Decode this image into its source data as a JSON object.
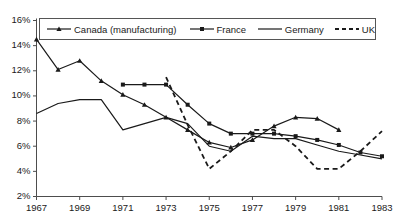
{
  "chart_data": {
    "type": "line",
    "title": "",
    "xlabel": "",
    "ylabel": "",
    "xlim": [
      1967,
      1983
    ],
    "ylim": [
      2,
      16
    ],
    "ytick_suffix": "%",
    "grid": false,
    "legend_position": "top",
    "xticks": [
      1967,
      1969,
      1971,
      1973,
      1975,
      1977,
      1979,
      1981,
      1983
    ],
    "yticks": [
      2,
      4,
      6,
      8,
      10,
      12,
      14,
      16
    ],
    "ytick_labels": [
      "2%",
      "4%",
      "6%",
      "8%",
      "10%",
      "12%",
      "14%",
      "16%"
    ],
    "xtick_labels": [
      "1967",
      "1969",
      "1971",
      "1973",
      "1975",
      "1977",
      "1979",
      "1981",
      "1983"
    ],
    "series": [
      {
        "name": "Canada (manufacturing)",
        "marker": "triangle",
        "dash": "solid",
        "color": "#1a1a1a",
        "x": [
          1967,
          1968,
          1969,
          1970,
          1971,
          1972,
          1973,
          1974,
          1975,
          1976,
          1977,
          1978,
          1979,
          1980,
          1981
        ],
        "values": [
          14.5,
          12.1,
          12.8,
          11.2,
          10.1,
          9.3,
          8.3,
          7.3,
          6.3,
          5.9,
          6.5,
          7.6,
          8.3,
          8.2,
          7.3
        ]
      },
      {
        "name": "France",
        "marker": "square",
        "dash": "solid",
        "color": "#1a1a1a",
        "x": [
          1971,
          1972,
          1973,
          1974,
          1975,
          1976,
          1977,
          1978,
          1979,
          1980,
          1981,
          1982,
          1983
        ],
        "values": [
          10.9,
          10.9,
          10.9,
          9.3,
          7.8,
          7.0,
          7.0,
          7.0,
          6.8,
          6.5,
          6.1,
          5.5,
          5.2
        ]
      },
      {
        "name": "Germany",
        "marker": "none",
        "dash": "solid",
        "color": "#1a1a1a",
        "x": [
          1967,
          1968,
          1969,
          1970,
          1971,
          1972,
          1973,
          1974,
          1975,
          1976,
          1977,
          1978,
          1979,
          1980,
          1981,
          1982,
          1983
        ],
        "values": [
          8.6,
          9.4,
          9.7,
          9.7,
          7.3,
          7.8,
          8.3,
          7.8,
          6.0,
          5.6,
          6.8,
          6.6,
          6.6,
          6.1,
          5.6,
          5.3,
          5.0
        ]
      },
      {
        "name": "UK",
        "marker": "none",
        "dash": "dashed",
        "color": "#1a1a1a",
        "x": [
          1973,
          1974,
          1975,
          1976,
          1977,
          1978,
          1979,
          1980,
          1981,
          1982,
          1983
        ],
        "values": [
          11.5,
          7.7,
          4.2,
          5.6,
          7.3,
          7.3,
          6.0,
          4.2,
          4.2,
          5.6,
          7.2
        ]
      }
    ]
  },
  "legend": {
    "entries": [
      {
        "label": "Canada (manufacturing)",
        "marker": "triangle",
        "dash": "solid"
      },
      {
        "label": "France",
        "marker": "square",
        "dash": "solid"
      },
      {
        "label": "Germany",
        "marker": "none",
        "dash": "solid"
      },
      {
        "label": "UK",
        "marker": "none",
        "dash": "dashed"
      }
    ]
  }
}
